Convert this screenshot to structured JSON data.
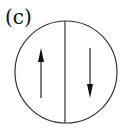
{
  "panel": {
    "label": "(c)"
  },
  "diagram": {
    "circle": {
      "cx": 66,
      "cy": 72,
      "r": 51,
      "stroke": "#333333"
    },
    "divider": {
      "x": 65,
      "y1": 21,
      "y2": 123
    },
    "arrows": [
      {
        "direction": "up",
        "x": 41,
        "y_tail": 98,
        "y_head": 48
      },
      {
        "direction": "down",
        "x": 90,
        "y_tail": 48,
        "y_head": 98
      }
    ]
  }
}
